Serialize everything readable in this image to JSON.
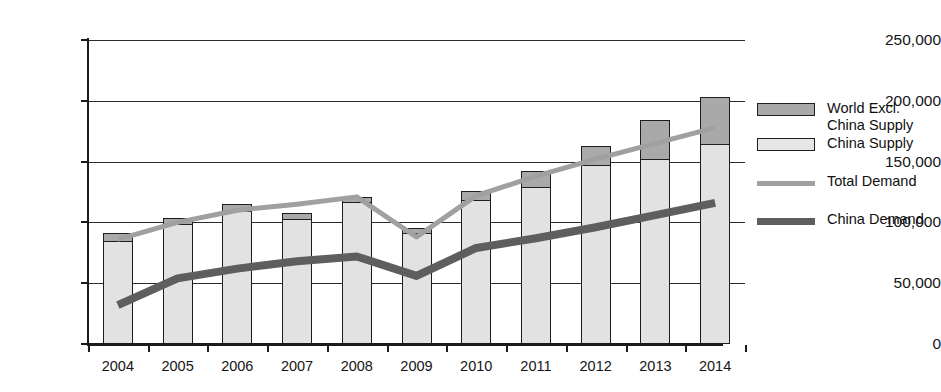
{
  "chart_data": {
    "type": "bar",
    "title": "",
    "xlabel": "",
    "ylabel": "",
    "ylim": [
      0,
      250000
    ],
    "yticks": [
      0,
      50000,
      100000,
      150000,
      200000,
      250000
    ],
    "ytick_labels": [
      "0",
      "50,000",
      "100,000",
      "150,000",
      "200,000",
      "250,000"
    ],
    "grid": true,
    "legend_position": "right",
    "stacked": true,
    "categories": [
      "2004",
      "2005",
      "2006",
      "2007",
      "2008",
      "2009",
      "2010",
      "2011",
      "2012",
      "2013",
      "2014"
    ],
    "series": [
      {
        "name": "China Supply",
        "kind": "bar",
        "color": "#e2e2e2",
        "values": [
          85000,
          99000,
          110000,
          103000,
          117000,
          92000,
          119000,
          130000,
          148000,
          153000,
          165000
        ]
      },
      {
        "name": "World Excl. China Supply",
        "kind": "bar",
        "color": "#a9a9a9",
        "values": [
          6000,
          5000,
          5000,
          5000,
          4000,
          3000,
          7000,
          12000,
          15000,
          31000,
          38000
        ]
      },
      {
        "name": "Total Demand",
        "kind": "line",
        "color": "#a0a0a0",
        "values": [
          86000,
          100000,
          110000,
          115000,
          121000,
          88000,
          122000,
          138000,
          152000,
          165000,
          178000
        ]
      },
      {
        "name": "China Demand",
        "kind": "line",
        "color": "#5e5e5e",
        "values": [
          32000,
          54000,
          62000,
          68000,
          72000,
          56000,
          79000,
          87000,
          96000,
          106000,
          116000
        ]
      }
    ],
    "bar_totals": [
      91000,
      104000,
      115000,
      108000,
      121000,
      95000,
      126000,
      142000,
      163000,
      184000,
      203000
    ]
  },
  "legend": {
    "items": [
      {
        "label": "World Excl. China Supply",
        "swatch": "box",
        "color": "#a9a9a9"
      },
      {
        "label": "China Supply",
        "swatch": "box",
        "color": "#e6e6e6"
      },
      {
        "label": "Total Demand",
        "swatch": "line",
        "color": "#a0a0a0"
      },
      {
        "label": "China Demand",
        "swatch": "line",
        "color": "#5e5e5e"
      }
    ]
  },
  "title_fragment": ""
}
